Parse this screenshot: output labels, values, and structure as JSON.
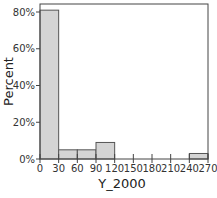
{
  "chart_data": {
    "type": "bar",
    "subtype": "histogram",
    "title": "",
    "xlabel": "Y_2000",
    "ylabel": "Percent",
    "bins": [
      {
        "start": 0,
        "end": 30,
        "value": 81
      },
      {
        "start": 30,
        "end": 60,
        "value": 5
      },
      {
        "start": 60,
        "end": 90,
        "value": 5
      },
      {
        "start": 90,
        "end": 120,
        "value": 9
      },
      {
        "start": 120,
        "end": 150,
        "value": 0
      },
      {
        "start": 150,
        "end": 180,
        "value": 0
      },
      {
        "start": 180,
        "end": 210,
        "value": 0
      },
      {
        "start": 210,
        "end": 240,
        "value": 0
      },
      {
        "start": 240,
        "end": 270,
        "value": 3
      }
    ],
    "categories": [
      "0-30",
      "30-60",
      "60-90",
      "90-120",
      "120-150",
      "150-180",
      "180-210",
      "210-240",
      "240-270"
    ],
    "values": [
      81,
      5,
      5,
      9,
      0,
      0,
      0,
      0,
      3
    ],
    "xlim": [
      0,
      270
    ],
    "ylim": [
      0,
      88
    ],
    "x_ticks": [
      "0",
      "30",
      "60",
      "90",
      "120",
      "150",
      "180",
      "210",
      "240",
      "270"
    ],
    "y_ticks": [
      "0%",
      "20%",
      "40%",
      "60%",
      "80%"
    ],
    "grid": false,
    "legend": null,
    "bar_color": "#d4d4d4",
    "bar_edge_color": "#555555"
  }
}
